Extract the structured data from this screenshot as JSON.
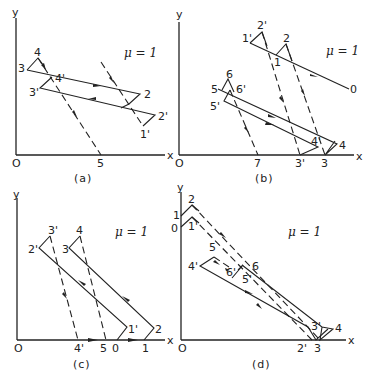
{
  "figure": {
    "mu_label": "μ = 1",
    "axis": {
      "x": "x",
      "y": "y",
      "origin": "O"
    },
    "panels": [
      {
        "caption": "(a)",
        "labels": [
          "3",
          "4",
          "4'",
          "3'",
          "2",
          "2'",
          "1",
          "1'",
          "5"
        ],
        "x_tick": "5"
      },
      {
        "caption": "(b)",
        "labels": [
          "1'",
          "2'",
          "2",
          "1",
          "0",
          "5",
          "6",
          "6'",
          "5'",
          "4'",
          "4",
          "7",
          "3'",
          "3"
        ]
      },
      {
        "caption": "(c)",
        "labels": [
          "3'",
          "4",
          "2'",
          "3",
          "1'",
          "2",
          "4'",
          "5",
          "0",
          "1"
        ]
      },
      {
        "caption": "(d)",
        "labels": [
          "1",
          "0",
          "2",
          "1'",
          "5",
          "4'",
          "6'",
          "6",
          "5'",
          "3'",
          "4",
          "2'",
          "3"
        ]
      }
    ]
  }
}
